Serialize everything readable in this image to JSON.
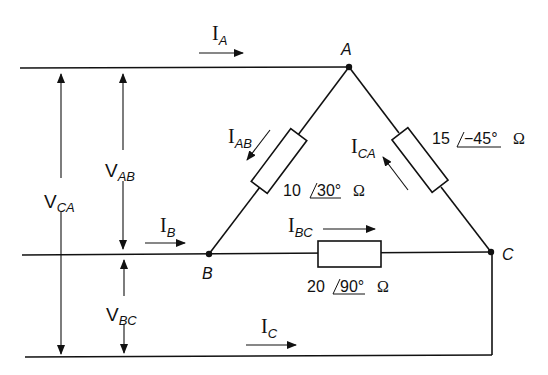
{
  "diagram": {
    "type": "delta-connected three-phase load",
    "nodes": [
      {
        "id": "A",
        "label": "A"
      },
      {
        "id": "B",
        "label": "B"
      },
      {
        "id": "C",
        "label": "C"
      }
    ],
    "line_currents": [
      {
        "id": "IA",
        "main": "I",
        "sub": "A",
        "direction": "right"
      },
      {
        "id": "IB",
        "main": "I",
        "sub": "B",
        "direction": "right"
      },
      {
        "id": "IC",
        "main": "I",
        "sub": "C",
        "direction": "right"
      }
    ],
    "phase_currents": [
      {
        "id": "IAB",
        "main": "I",
        "sub": "AB",
        "direction": "A to B"
      },
      {
        "id": "IBC",
        "main": "I",
        "sub": "BC",
        "direction": "B to C"
      },
      {
        "id": "ICA",
        "main": "I",
        "sub": "CA",
        "direction": "C to A"
      }
    ],
    "voltages": [
      {
        "id": "VAB",
        "main": "V",
        "sub": "AB"
      },
      {
        "id": "VBC",
        "main": "V",
        "sub": "BC"
      },
      {
        "id": "VCA",
        "main": "V",
        "sub": "CA"
      }
    ],
    "impedances": [
      {
        "branch": "AB",
        "magnitude": "10",
        "angle": "30°",
        "unit": "Ω"
      },
      {
        "branch": "CA",
        "magnitude": "15",
        "angle": "−45°",
        "unit": "Ω"
      },
      {
        "branch": "BC",
        "magnitude": "20",
        "angle": "90°",
        "unit": "Ω"
      }
    ],
    "colors": {
      "line": "#111111",
      "background": "#ffffff"
    }
  }
}
